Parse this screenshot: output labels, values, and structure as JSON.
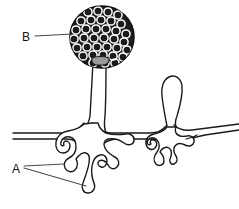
{
  "diagram": {
    "background_color": "#ffffff",
    "line_color": "#1a1a1a",
    "labels": [
      {
        "id": "label-a",
        "text": "A",
        "x": 17,
        "y": 169,
        "points_to": "rhizoids",
        "leader_count": 2
      },
      {
        "id": "label-b",
        "text": "B",
        "x": 27,
        "y": 37,
        "points_to": "sporangium",
        "leader_count": 1
      }
    ],
    "structures": {
      "sporangium": {
        "name": "sporangium",
        "fill_color": "#1c1c1c",
        "spore_color": "#ffffff",
        "spore_rows": 7,
        "spore_count": 38,
        "center_x": 102,
        "center_y": 37,
        "radius_x": 32,
        "radius_y": 31
      },
      "columella": {
        "name": "columella",
        "fill_color": "#9a9a9a"
      },
      "sporangiophore": {
        "name": "sporangiophore-stalk",
        "top_y": 63,
        "bottom_y": 132
      },
      "stolon": {
        "name": "stolon",
        "left_x": 12,
        "right_x": 239,
        "y": 133
      },
      "rhizoid_left": {
        "name": "rhizoid-cluster-left",
        "lobes": 5
      },
      "rhizoid_right": {
        "name": "rhizoid-cluster-right",
        "lobes": 4
      },
      "young_sporangiophore": {
        "name": "young-sporangiophore-loop",
        "top_y": 76
      }
    }
  }
}
